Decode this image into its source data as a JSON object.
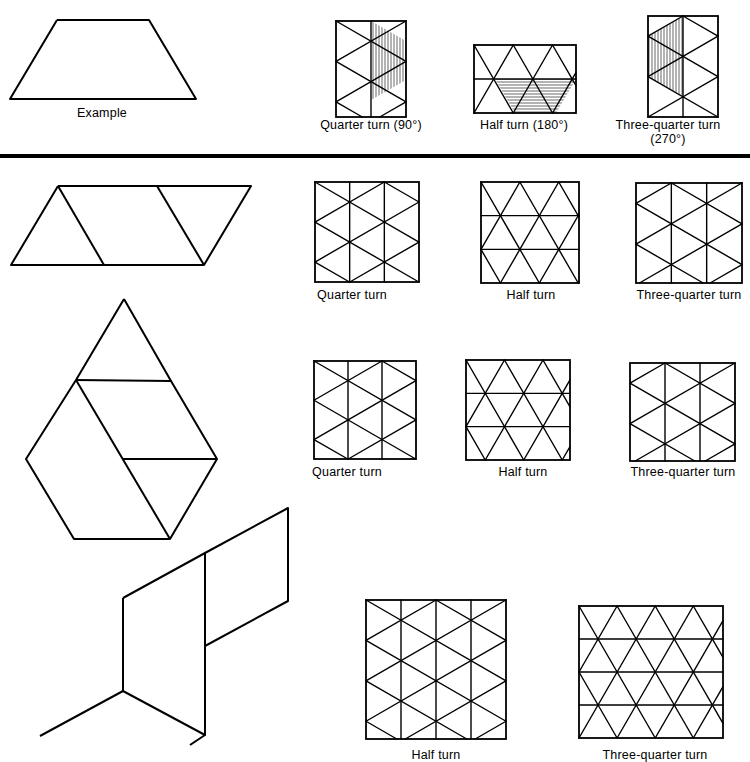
{
  "colors": {
    "ink": "#000000",
    "paper": "#ffffff"
  },
  "example": {
    "label": "Example",
    "shape": [
      [
        57,
        20
      ],
      [
        149,
        20
      ],
      [
        196,
        99
      ],
      [
        10,
        99
      ]
    ],
    "label_pos": [
      102,
      106
    ],
    "turns": [
      {
        "name": "quarter",
        "label": "Quarter turn (90°)",
        "label_pos": [
          371,
          118
        ],
        "grid": "vertical",
        "x0": 336,
        "y0": 21,
        "x1": 406,
        "y1": 117,
        "cols": 2,
        "offset": 0,
        "shade": {
          "type": "vertical",
          "poly": [
            [
              371,
              21
            ],
            [
              406,
              41
            ],
            [
              406,
              80
            ],
            [
              371,
              100
            ]
          ]
        }
      },
      {
        "name": "half",
        "label": "Half turn (180°)",
        "label_pos": [
          524,
          118
        ],
        "grid": "horizontal",
        "x0": 474,
        "y0": 45,
        "x1": 576,
        "y1": 113,
        "rows": 2,
        "shade": {
          "type": "horizontal",
          "poly": [
            [
              495,
              79
            ],
            [
              576,
              79
            ],
            [
              556,
              113
            ],
            [
              515,
              113
            ]
          ]
        }
      },
      {
        "name": "three-quarter",
        "label_lines": [
          "Three-quarter turn",
          "(270°)"
        ],
        "label_pos": [
          668,
          118
        ],
        "grid": "vertical",
        "x0": 648,
        "y0": 16,
        "x1": 718,
        "y1": 117,
        "cols": 2,
        "offset": 1,
        "shade": {
          "type": "vertical",
          "poly": [
            [
              683,
              16
            ],
            [
              683,
              96
            ],
            [
              648,
              77
            ],
            [
              648,
              37
            ]
          ]
        }
      }
    ]
  },
  "rows": [
    {
      "shape_name": "parallelogram-of-triangles",
      "shape_lines": [
        [
          [
            58,
            186
          ],
          [
            251,
            186
          ],
          [
            204,
            265
          ],
          [
            11,
            265
          ],
          [
            58,
            186
          ]
        ],
        [
          [
            58,
            186
          ],
          [
            104,
            265
          ]
        ],
        [
          [
            157,
            186
          ],
          [
            204,
            265
          ]
        ]
      ],
      "panels": [
        {
          "name": "quarter-turn",
          "label": "Quarter turn",
          "label_pos": [
            352,
            288
          ],
          "grid": "vertical",
          "x0": 315,
          "y0": 182,
          "x1": 419,
          "y1": 282,
          "cols": 3,
          "offset": 0
        },
        {
          "name": "half-turn",
          "label": "Half turn",
          "label_pos": [
            531,
            288
          ],
          "grid": "horizontal",
          "x0": 481,
          "y0": 182,
          "x1": 579,
          "y1": 283,
          "rows": 3
        },
        {
          "name": "three-quarter-turn",
          "label": "Three-quarter turn",
          "label_pos": [
            689,
            288
          ],
          "grid": "vertical",
          "x0": 636,
          "y0": 183,
          "x1": 742,
          "y1": 283,
          "cols": 3,
          "offset": 1
        }
      ]
    },
    {
      "shape_name": "hexagon-with-triangle",
      "shape_lines": [
        [
          [
            124,
            299
          ],
          [
            171,
            381
          ],
          [
            217,
            459
          ],
          [
            170,
            539
          ],
          [
            74,
            539
          ],
          [
            26,
            459
          ],
          [
            76,
            380
          ],
          [
            124,
            299
          ]
        ],
        [
          [
            76,
            380
          ],
          [
            171,
            381
          ]
        ],
        [
          [
            76,
            380
          ],
          [
            170,
            539
          ]
        ],
        [
          [
            123,
            459
          ],
          [
            217,
            459
          ]
        ]
      ],
      "panels": [
        {
          "name": "quarter-turn",
          "label": "Quarter turn",
          "label_pos": [
            347,
            465
          ],
          "grid": "vertical",
          "x0": 314,
          "y0": 361,
          "x1": 416,
          "y1": 459,
          "cols": 3,
          "offset": 0
        },
        {
          "name": "half-turn",
          "label": "Half turn",
          "label_pos": [
            523,
            465
          ],
          "grid": "horizontal",
          "x0": 466,
          "y0": 360,
          "x1": 570,
          "y1": 460,
          "rows": 3
        },
        {
          "name": "three-quarter-turn",
          "label": "Three-quarter turn",
          "label_pos": [
            683,
            465
          ],
          "grid": "vertical",
          "x0": 630,
          "y0": 363,
          "x1": 735,
          "y1": 461,
          "cols": 3,
          "offset": 1
        }
      ]
    },
    {
      "shape_name": "three-rhombus-zigzag",
      "shape_lines": [
        [
          [
            123,
            598
          ],
          [
            205,
            553
          ],
          [
            288,
            508
          ],
          [
            288,
            601
          ],
          [
            205,
            646
          ]
        ],
        [
          [
            123,
            598
          ],
          [
            123,
            691
          ],
          [
            205,
            735
          ],
          [
            205,
            553
          ]
        ],
        [
          [
            123,
            691
          ],
          [
            40,
            736
          ]
        ],
        [
          [
            205,
            735
          ],
          [
            190,
            745
          ]
        ]
      ],
      "panels": [
        {
          "name": "half-turn",
          "label": "Half turn",
          "label_pos": [
            436,
            748
          ],
          "grid": "vertical",
          "x0": 366,
          "y0": 600,
          "x1": 506,
          "y1": 739,
          "cols": 4,
          "offset": 0
        },
        {
          "name": "three-quarter-turn",
          "label": "Three-quarter turn",
          "label_pos": [
            655,
            748
          ],
          "grid": "horizontal",
          "x0": 579,
          "y0": 606,
          "x1": 723,
          "y1": 738,
          "rows": 4
        }
      ]
    }
  ],
  "divider_y": 154
}
